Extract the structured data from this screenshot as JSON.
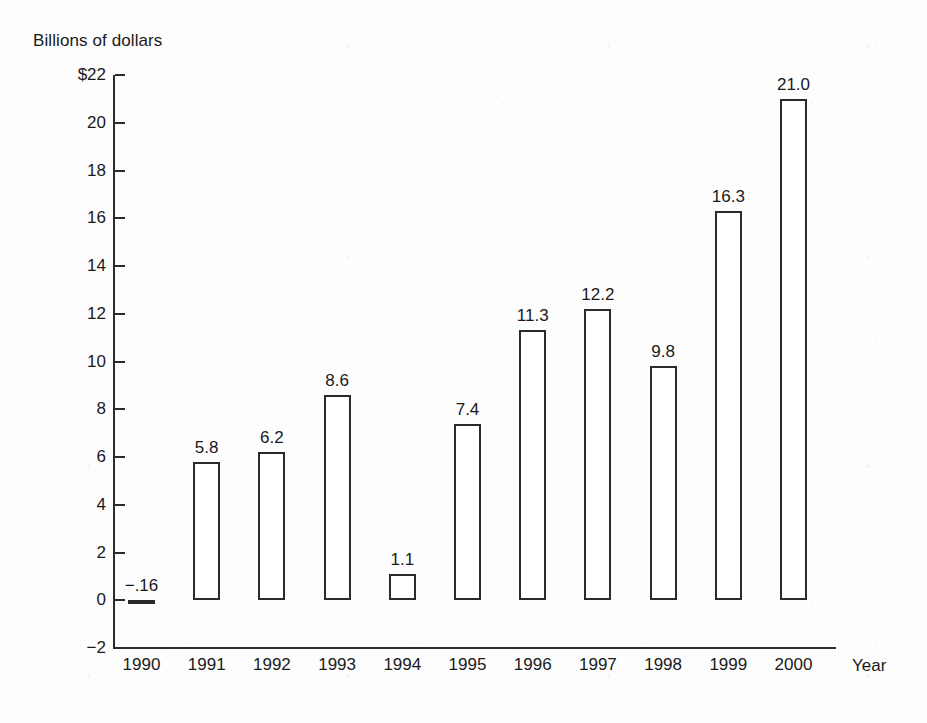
{
  "chart_data": {
    "type": "bar",
    "title": "",
    "ylabel": "Billions of dollars",
    "xlabel": "Year",
    "categories": [
      "1990",
      "1991",
      "1992",
      "1993",
      "1994",
      "1995",
      "1996",
      "1997",
      "1998",
      "1999",
      "2000"
    ],
    "values": [
      -0.16,
      5.8,
      6.2,
      8.6,
      1.1,
      7.4,
      11.3,
      12.2,
      9.8,
      16.3,
      21.0
    ],
    "value_labels": [
      "−.16",
      "5.8",
      "6.2",
      "8.6",
      "1.1",
      "7.4",
      "11.3",
      "12.2",
      "9.8",
      "16.3",
      "21.0"
    ],
    "ylim": [
      -2,
      22
    ],
    "ytick_values": [
      22,
      20,
      18,
      16,
      14,
      12,
      10,
      8,
      6,
      4,
      2,
      0,
      -2
    ],
    "ytick_labels": [
      "$22",
      "20",
      "18",
      "16",
      "14",
      "12",
      "10",
      "8",
      "6",
      "4",
      "2",
      "0",
      "−2"
    ],
    "grid": false,
    "legend": null,
    "bar_fill": "#ffffff",
    "bar_stroke": "#2b2b2b",
    "background": "#fdfdfd"
  }
}
